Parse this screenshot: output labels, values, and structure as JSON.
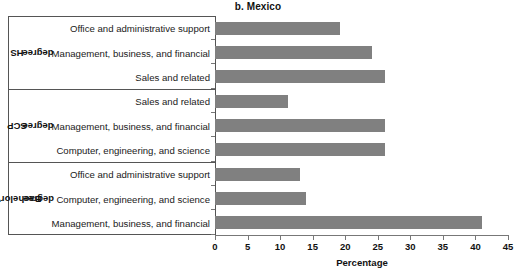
{
  "chart_data": {
    "type": "bar",
    "orientation": "horizontal",
    "title": "b. Mexico",
    "xlabel": "Percentage",
    "ylabel": "",
    "xlim": [
      0,
      45
    ],
    "xticks": [
      0,
      5,
      10,
      15,
      20,
      25,
      30,
      35,
      40,
      45
    ],
    "xtick_labels": [
      "0",
      "5",
      "10",
      "15",
      "20",
      "25",
      "30",
      "35",
      "40",
      "45"
    ],
    "grid": false,
    "legend": false,
    "bar_color": "#808080",
    "groups": [
      {
        "name": "HS degree",
        "categories": [
          "Office and administrative support",
          "Management, business, and financial",
          "Sales and related"
        ],
        "values": [
          19.2,
          24.1,
          26.1
        ]
      },
      {
        "name": "SCP degree",
        "categories": [
          "Sales and related",
          "Management, business, and financial",
          "Computer, engineering, and science"
        ],
        "values": [
          11.2,
          26.1,
          26.1
        ]
      },
      {
        "name": "Bachelor's degree",
        "categories": [
          "Office and administrative support",
          "Computer, engineering, and science",
          "Management, business, and financial"
        ],
        "values": [
          13.1,
          14.0,
          41.0
        ]
      }
    ],
    "categories": [
      "Office and administrative support",
      "Management, business, and financial",
      "Sales and related",
      "Sales and related",
      "Management, business, and financial",
      "Computer, engineering, and science",
      "Office and administrative support",
      "Computer, engineering, and science",
      "Management, business, and financial"
    ],
    "values": [
      19.2,
      24.1,
      26.1,
      11.2,
      26.1,
      26.1,
      13.1,
      14.0,
      41.0
    ]
  },
  "group_labels": {
    "hs": {
      "line1": "HS",
      "line2": "degree"
    },
    "scp": {
      "line1": "SCP",
      "line2": "degree"
    },
    "bachelors": {
      "line1": "Bachelor's",
      "line2": "degree"
    }
  }
}
